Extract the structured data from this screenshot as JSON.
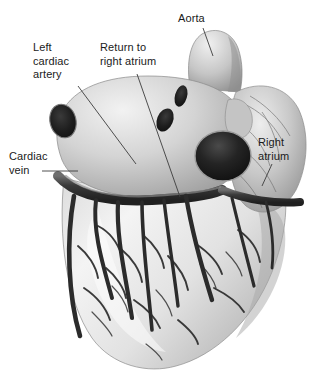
{
  "figure": {
    "type": "anatomical-illustration",
    "style": "grayscale-airbrush",
    "background_color": "#ffffff",
    "width": 314,
    "height": 380
  },
  "labels": {
    "aorta": "Aorta",
    "left_cardiac_artery": "Left\ncardiac\nartery",
    "return_to_right_atrium": "Return to\nright atrium",
    "cardiac_vein": "Cardiac\nvein",
    "right_atrium": "Right\natrium"
  },
  "colors": {
    "text": "#1a1a1a",
    "leader_line": "#3c3c3c",
    "vessel_dark": "#2e2e2e",
    "vessel_mid": "#585858",
    "muscle_light": "#e8e8e8",
    "muscle_mid": "#bdbdbd",
    "muscle_shadow": "#8e8e8e",
    "opening_dark": "#1f1f1f"
  },
  "structures": {
    "aorta": "great vessel stump, top center",
    "pulmonary_veins": "two small dark openings, upper center",
    "left_pulmonary_opening": "dark elliptical opening, left",
    "vena_cava": "large dark circular opening, right of center",
    "right_atrium": "lobed chamber, right side",
    "coronary_sinus": "thick dark horizontal vessel across mid-heart",
    "ventricle": "large conical muscle body, lower portion",
    "coronary_branches": "branching dark vessels descending over ventricle"
  }
}
